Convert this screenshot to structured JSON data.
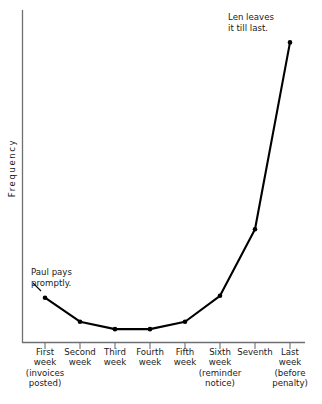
{
  "chart_data": {
    "type": "line",
    "title": "",
    "xlabel": "",
    "ylabel": "Frequency",
    "grid": false,
    "legend": null,
    "xlim": [
      0,
      9
    ],
    "ylim": [
      0,
      360
    ],
    "categories": [
      "First week (invoices posted)",
      "Second week",
      "Third week",
      "Fourth week",
      "Fifth week",
      "Sixth week (reminder notice)",
      "Seventh",
      "Last week (before penalty)"
    ],
    "values": [
      49,
      23,
      15,
      15,
      23,
      51,
      123,
      325
    ],
    "annotations": [
      {
        "text": "Paul pays promptly.",
        "points_to_index": 0
      },
      {
        "text": "Len leaves it till last.",
        "points_to_index": 7
      }
    ]
  },
  "axes": {
    "y_label": "Frequency"
  },
  "x_tick_labels": [
    {
      "lines": "First\nweek\n(invoices\nposted)"
    },
    {
      "lines": "Second\nweek"
    },
    {
      "lines": "Third\nweek"
    },
    {
      "lines": "Fourth\nweek"
    },
    {
      "lines": "Fifth\nweek"
    },
    {
      "lines": "Sixth\nweek\n(reminder\nnotice)"
    },
    {
      "lines": "Seventh"
    },
    {
      "lines": "Last\nweek\n(before\npenalty)"
    }
  ],
  "annotations": {
    "paul": "Paul pays\npromptly.",
    "len": "Len leaves\nit till last."
  },
  "colors": {
    "line": "#000000",
    "axis": "#6e7073",
    "text": "#1a1a1a",
    "background": "#ffffff"
  }
}
